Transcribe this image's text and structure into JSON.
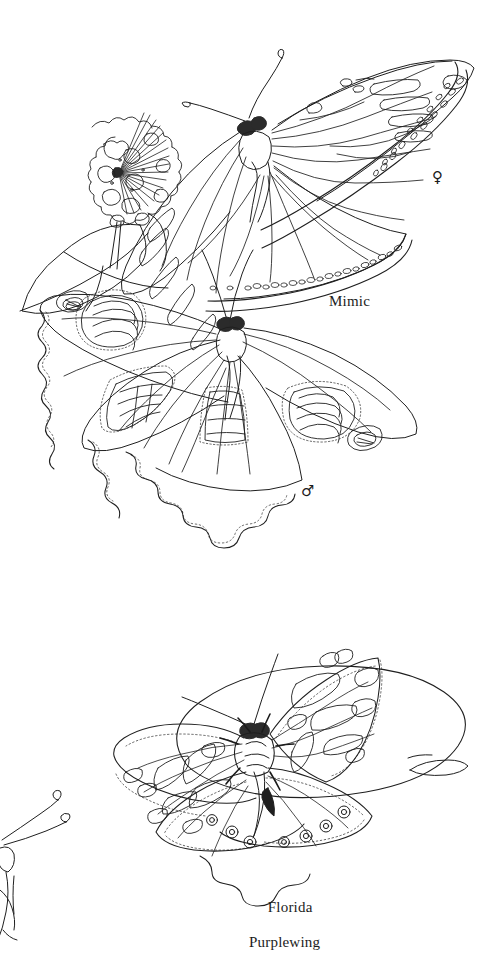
{
  "plate": {
    "kind": "field-guide-illustration-plate",
    "background_color": "#ffffff",
    "ink_color": "#1c1c1c",
    "width": 504,
    "height": 944
  },
  "figures": [
    {
      "id": "mimic",
      "common_name": "Mimic",
      "label": "Mimic",
      "label_position": {
        "x": 329,
        "y": 293
      },
      "specimens": [
        {
          "sex": "female",
          "sex_symbol": "♀",
          "symbol_position": {
            "x": 432,
            "y": 170
          },
          "view": "dorsal",
          "description": "upper butterfly with spread wings, veined forewings and white-spotted dark margins"
        },
        {
          "sex": "male",
          "sex_symbol": "♂",
          "symbol_position": {
            "x": 301,
            "y": 484
          },
          "view": "dorsal",
          "description": "lower butterfly with scalloped wings and banded pale patches"
        }
      ],
      "plant": {
        "name": "flower-cluster",
        "description": "round umbel flower head with radiating stalks on a stem with leaves"
      }
    },
    {
      "id": "florida-purplewing",
      "common_name": "Florida Purplewing",
      "label_lines": [
        "Florida",
        "Purplewing"
      ],
      "label_line_1": "Florida",
      "label_line_2": "Purplewing",
      "label_position": {
        "x": 252,
        "y": 881
      },
      "specimens": [
        {
          "sex": "unspecified",
          "view": "dorsal",
          "description": "butterfly perched on a broad leaf, angular white patches on forewings and a row of small ringed eyespots along the hindwing margins"
        }
      ],
      "plant": {
        "name": "broad-leaf",
        "description": "large oval leaf with a curving stem at the right"
      },
      "partial_figure": {
        "name": "cropped-butterfly-head",
        "description": "partial butterfly head with two long antennae cropped at the left edge"
      }
    }
  ]
}
